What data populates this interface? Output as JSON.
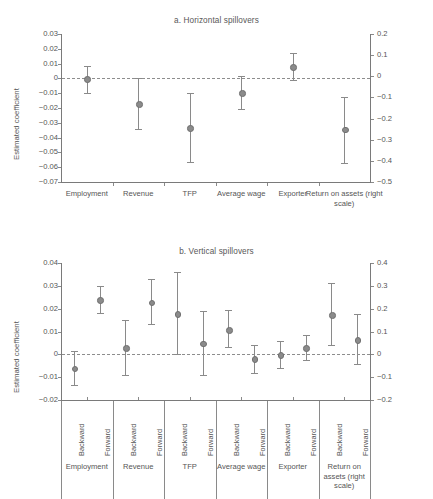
{
  "chart_data": [
    {
      "type": "scatter",
      "id": "panel-a",
      "title": "a. Horizontal spillovers",
      "ylabel": "Estimated coefficient",
      "xlabel": "",
      "grid": false,
      "legend": "none",
      "zero_line": true,
      "yticks_left": [
        "0.03",
        "0.02",
        "0.01",
        "0",
        "−0.01",
        "−0.02",
        "−0.03",
        "−0.04",
        "−0.05",
        "−0.06",
        "−0.07"
      ],
      "ylim_left": [
        -0.07,
        0.03
      ],
      "yticks_right": [
        "0.2",
        "0.1",
        "0",
        "−0.1",
        "−0.2",
        "−0.3",
        "−0.4",
        "−0.5"
      ],
      "ylim_right": [
        -0.5,
        0.2
      ],
      "categories": [
        "Employment",
        "Revenue",
        "TFP",
        "Average wage",
        "Exporter",
        "Return on assets (right scale)"
      ],
      "points": [
        {
          "label": "Employment",
          "value": 0.0,
          "low": -0.0098,
          "high": 0.0082,
          "axis": "left"
        },
        {
          "label": "Revenue",
          "value": -0.0168,
          "low": -0.0342,
          "high": 0.0002,
          "axis": "left"
        },
        {
          "label": "TFP",
          "value": -0.033,
          "low": -0.0565,
          "high": -0.0098,
          "axis": "left"
        },
        {
          "label": "Average wage",
          "value": -0.0097,
          "low": -0.021,
          "high": 0.0018,
          "axis": "left"
        },
        {
          "label": "Exporter",
          "value": 0.0081,
          "low": -0.001,
          "high": 0.0172,
          "axis": "left"
        },
        {
          "label": "Return on assets (right scale)",
          "value": -0.25,
          "low": -0.41,
          "high": -0.1,
          "axis": "right"
        }
      ]
    },
    {
      "type": "scatter",
      "id": "panel-b",
      "title": "b. Vertical spillovers",
      "ylabel": "Estimated coefficient",
      "xlabel": "",
      "grid": false,
      "legend": "none",
      "zero_line": true,
      "yticks_left": [
        "0.04",
        "0.03",
        "0.02",
        "0.01",
        "0",
        "−0.01",
        "−0.02"
      ],
      "ylim_left": [
        -0.02,
        0.04
      ],
      "yticks_right": [
        "0.4",
        "0.3",
        "0.2",
        "0.1",
        "0",
        "−0.1",
        "−0.2"
      ],
      "ylim_right": [
        -0.2,
        0.4
      ],
      "groups": [
        "Employment",
        "Revenue",
        "TFP",
        "Average wage",
        "Exporter",
        "Return on assets (right scale)"
      ],
      "subcategories": [
        "Backward",
        "Forward"
      ],
      "points": [
        {
          "group": "Employment",
          "sub": "Backward",
          "value": -0.006,
          "low": -0.0134,
          "high": 0.0014,
          "axis": "left"
        },
        {
          "group": "Employment",
          "sub": "Forward",
          "value": 0.0241,
          "low": 0.0183,
          "high": 0.03,
          "axis": "left"
        },
        {
          "group": "Revenue",
          "sub": "Backward",
          "value": 0.0029,
          "low": -0.009,
          "high": 0.015,
          "axis": "left"
        },
        {
          "group": "Revenue",
          "sub": "Forward",
          "value": 0.023,
          "low": 0.0132,
          "high": 0.033,
          "axis": "left"
        },
        {
          "group": "TFP",
          "sub": "Backward",
          "value": 0.018,
          "low": 0.0,
          "high": 0.036,
          "axis": "left"
        },
        {
          "group": "TFP",
          "sub": "Forward",
          "value": 0.005,
          "low": -0.009,
          "high": 0.019,
          "axis": "left"
        },
        {
          "group": "Average wage",
          "sub": "Backward",
          "value": 0.011,
          "low": 0.0032,
          "high": 0.0192,
          "axis": "left"
        },
        {
          "group": "Average wage",
          "sub": "Forward",
          "value": -0.0019,
          "low": -0.0081,
          "high": 0.0041,
          "axis": "left"
        },
        {
          "group": "Exporter",
          "sub": "Backward",
          "value": 0.0,
          "low": -0.0058,
          "high": 0.0058,
          "axis": "left"
        },
        {
          "group": "Exporter",
          "sub": "Forward",
          "value": 0.0031,
          "low": -0.0024,
          "high": 0.0086,
          "axis": "left"
        },
        {
          "group": "Return on assets (right scale)",
          "sub": "Backward",
          "value": 0.175,
          "low": 0.04,
          "high": 0.312,
          "axis": "right"
        },
        {
          "group": "Return on assets (right scale)",
          "sub": "Forward",
          "value": 0.065,
          "low": -0.042,
          "high": 0.175,
          "axis": "right"
        }
      ]
    }
  ],
  "panel_a": {
    "title": "a. Horizontal spillovers",
    "ylabel": "Estimated coefficient"
  },
  "panel_b": {
    "title": "b. Vertical spillovers",
    "ylabel": "Estimated coefficient"
  },
  "colors": {
    "marker": "#8b8b8b",
    "axis": "#7a7a7a",
    "text": "#555555",
    "background": "#ffffff"
  }
}
